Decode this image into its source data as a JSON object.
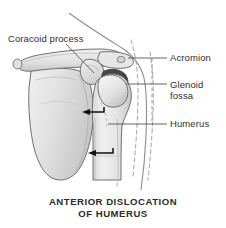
{
  "figure": {
    "background_color": "#ffffff"
  },
  "labels": {
    "coracoid": "Coracoid process",
    "acromion": "Acromion",
    "glenoid_line_1": "Glenoid",
    "glenoid_line_2": "fossa",
    "humerus": "Humerus"
  },
  "caption": {
    "line_1": "ANTERIOR DISLOCATION",
    "line_2": "OF HUMERUS"
  },
  "colors": {
    "bone_fill": "#e3e3e3",
    "bone_fill_light": "#eeeeee",
    "bone_shadow": "#c4c4c4",
    "bone_outline": "#6f6f6f",
    "glenoid_fossa_dark": "#454545",
    "arrow": "#111111",
    "label_text": "#2e2e2e",
    "caption_text": "#2b2b2b",
    "leader_line": "#555555",
    "dashed_outline": "#8a8a8a",
    "body_contour": "#777777"
  },
  "annotations": {
    "arrow_upper": "medial displacement arrow at humeral head",
    "arrow_lower": "medial displacement arrow at humeral shaft",
    "dashed_lines": "normal (pre-dislocation) arm position outline"
  }
}
